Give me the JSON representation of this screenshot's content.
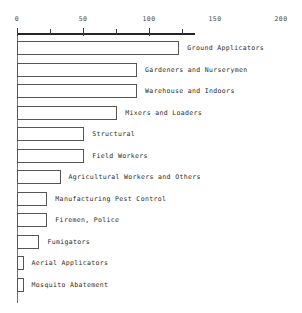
{
  "chart_data": {
    "type": "bar",
    "orientation": "horizontal",
    "title": "",
    "xlabel": "",
    "ylabel": "",
    "xlim": [
      0,
      200
    ],
    "xticks": [
      0,
      50,
      100,
      150,
      200
    ],
    "xticklabels": [
      "0",
      "50",
      "100",
      "150",
      "200"
    ],
    "minor_ticks": [
      25,
      75,
      125
    ],
    "grid": false,
    "legend": null,
    "categories": [
      "Ground Applicators",
      "Gardeners and Nurserymen",
      "Warehouse and Indoors",
      "Mixers and Loaders",
      "Structural",
      "Field Workers",
      "Agricultural Workers and Others",
      "Manufacturing Pest Control",
      "Firemen, Police",
      "Fumigators",
      "Aerial Applicators",
      "Mosquito Abatement"
    ],
    "values": [
      123,
      91,
      91,
      76,
      51,
      51,
      33,
      23,
      23,
      17,
      5,
      5
    ],
    "bar_facecolor": "#ffffff",
    "bar_edgecolor": "#555555",
    "axis_color": "#262626"
  }
}
